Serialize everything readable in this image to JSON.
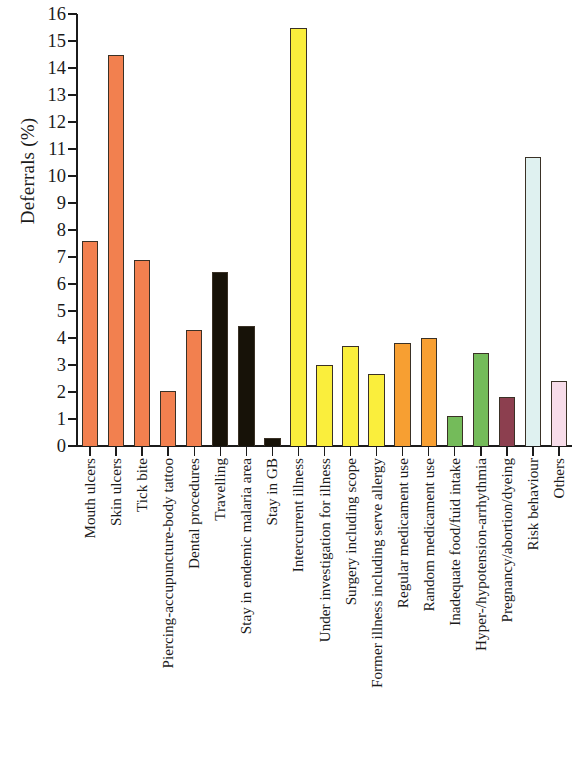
{
  "chart_data": {
    "type": "bar",
    "title": "",
    "subtitle": "",
    "xlabel": "",
    "ylabel": "Deferrals (%)",
    "ylim": [
      0,
      16
    ],
    "ytick_labels": [
      "16",
      "15",
      "14",
      "13",
      "12",
      "11",
      "10",
      "9",
      "8",
      "7",
      "6",
      "5",
      "4",
      "3",
      "2",
      "1",
      "0"
    ],
    "ytick_values": [
      16,
      15,
      14,
      13,
      12,
      11,
      10,
      9,
      8,
      7,
      6,
      5,
      4,
      3,
      2,
      1,
      0
    ],
    "grid": false,
    "legend": "none",
    "categories": [
      "Mouth ulcers",
      "Skin ulcers",
      "Tick bite",
      "Piercing-accupuncture-body tattoo",
      "Dental procedures",
      "Travelling",
      "Stay in endemic malaria area",
      "Stay in GB",
      "Intercurrent illness",
      "Under investigation for illness",
      "Surgery including scope",
      "Former illness including serve allergy",
      "Regular medicament use",
      "Random medicament use",
      "Inadequate food/fuid intake",
      "Hyper-/hypotension-arrhythmia",
      "Pregnancy/abortion/dyeing",
      "Risk behaviour",
      "Others"
    ],
    "values": [
      7.6,
      14.5,
      6.9,
      2.05,
      4.3,
      6.45,
      4.45,
      0.3,
      15.5,
      3.0,
      3.7,
      2.65,
      3.8,
      4.0,
      1.1,
      3.45,
      1.8,
      10.7,
      2.4
    ],
    "bar_colors": [
      "#F2804F",
      "#F2804F",
      "#F2804F",
      "#F2804F",
      "#F2804F",
      "#171208",
      "#171208",
      "#171208",
      "#FAEE3C",
      "#FAEE3C",
      "#FAEE3C",
      "#FAEE3C",
      "#F79F32",
      "#F79F32",
      "#74BB5A",
      "#74BB5A",
      "#8C3F4F",
      "#DFF1F0",
      "#F7DCE9"
    ],
    "bar_edge_color": "#3a3126",
    "axis_color": "#1b1b1b",
    "background_color": "#ffffff"
  }
}
